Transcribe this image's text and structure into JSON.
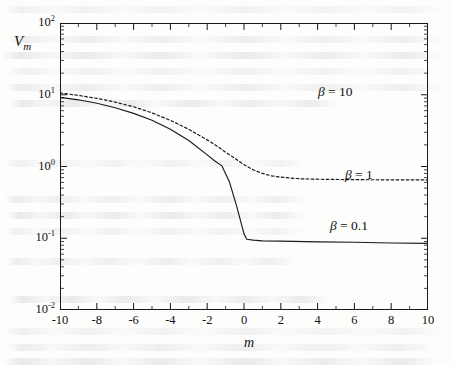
{
  "figure": {
    "background_color": "#fdfdfc",
    "ink_color": "#1a1a1a"
  },
  "ylabel_main": "V",
  "ylabel_sub": "m",
  "xlabel": "m",
  "annotations": [
    {
      "beta_symbol": "β",
      "text": " = 10",
      "left": 318,
      "top": 85
    },
    {
      "beta_symbol": "β",
      "text": " = 1",
      "left": 345,
      "top": 168
    },
    {
      "beta_symbol": "β",
      "text": " = 0.1",
      "left": 330,
      "top": 219
    }
  ],
  "bleed_lines": [
    {
      "left": 4,
      "top": 6,
      "width": 440
    },
    {
      "left": 6,
      "top": 36,
      "width": 436
    },
    {
      "left": 2,
      "top": 52,
      "width": 442
    },
    {
      "left": 8,
      "top": 68,
      "width": 432
    },
    {
      "left": 4,
      "top": 84,
      "width": 438
    },
    {
      "left": 10,
      "top": 100,
      "width": 330
    },
    {
      "left": 6,
      "top": 160,
      "width": 300
    },
    {
      "left": 4,
      "top": 196,
      "width": 300
    },
    {
      "left": 8,
      "top": 212,
      "width": 296
    },
    {
      "left": 4,
      "top": 228,
      "width": 300
    },
    {
      "left": 6,
      "top": 258,
      "width": 290
    },
    {
      "left": 10,
      "top": 296,
      "width": 320
    },
    {
      "left": 4,
      "top": 328,
      "width": 440
    },
    {
      "left": 6,
      "top": 344,
      "width": 430
    },
    {
      "left": 4,
      "top": 358,
      "width": 436
    }
  ],
  "chart_data": {
    "type": "line",
    "title": "",
    "xlabel": "m",
    "ylabel": "V_m",
    "xscale": "linear",
    "yscale": "log",
    "xlim": [
      -10,
      10
    ],
    "ylim": [
      0.01,
      100
    ],
    "xticks": [
      -10,
      -8,
      -6,
      -4,
      -2,
      0,
      2,
      4,
      6,
      8,
      10
    ],
    "xtick_labels": [
      "-10",
      "-8",
      "-6",
      "-4",
      "-2",
      "0",
      "2",
      "4",
      "6",
      "8",
      "10"
    ],
    "yticks": [
      0.01,
      0.1,
      1,
      10,
      100
    ],
    "ytick_labels": [
      "10-2",
      "10-1",
      "100",
      "101",
      "102"
    ],
    "ytick_label_parts": [
      {
        "base": "10",
        "exp": "-2"
      },
      {
        "base": "10",
        "exp": "-1"
      },
      {
        "base": "10",
        "exp": "0"
      },
      {
        "base": "10",
        "exp": "1"
      },
      {
        "base": "10",
        "exp": "2"
      }
    ],
    "minor_ticks": true,
    "grid": false,
    "legend": "inline annotations",
    "series": [
      {
        "name": "beta = 0.1",
        "label": "β = 0.1",
        "style": "solid",
        "color": "#1a1a1a",
        "x": [
          -10,
          -9,
          -8,
          -7,
          -6,
          -5,
          -4,
          -3,
          -2,
          -1.6,
          -1.2,
          -0.8,
          -0.4,
          0,
          0.15,
          0.5,
          1,
          2,
          4,
          6,
          8,
          10
        ],
        "y": [
          9.2,
          8.5,
          7.6,
          6.6,
          5.5,
          4.4,
          3.3,
          2.3,
          1.45,
          1.2,
          1.02,
          0.62,
          0.28,
          0.115,
          0.097,
          0.094,
          0.092,
          0.091,
          0.089,
          0.088,
          0.086,
          0.085
        ]
      },
      {
        "name": "beta = 1",
        "label": "β = 1",
        "style": "dotted",
        "color": "#1a1a1a",
        "x": [
          -10,
          -9,
          -8,
          -7,
          -6,
          -5,
          -4,
          -3,
          -2,
          -1.5,
          -1,
          -0.5,
          0,
          0.5,
          1,
          1.5,
          2,
          3,
          4,
          5,
          6,
          8,
          10
        ],
        "y": [
          10.6,
          9.8,
          8.9,
          7.9,
          6.8,
          5.6,
          4.4,
          3.3,
          2.35,
          1.95,
          1.58,
          1.3,
          1.06,
          0.9,
          0.8,
          0.74,
          0.71,
          0.675,
          0.665,
          0.66,
          0.655,
          0.652,
          0.65
        ]
      }
    ]
  }
}
